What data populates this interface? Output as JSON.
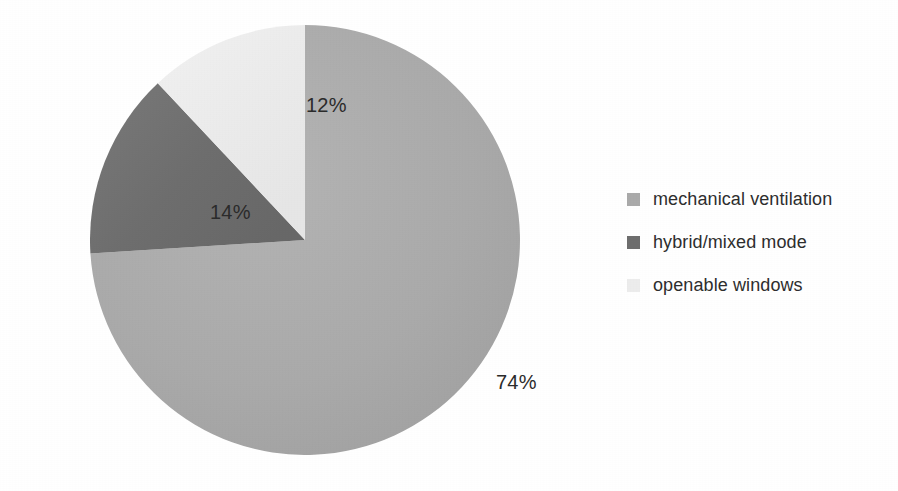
{
  "figure": {
    "background_color": "#ffffff",
    "text_color": "#2e2e2e"
  },
  "chart_data": {
    "type": "pie",
    "title": "",
    "xlabel": "",
    "ylabel": "",
    "categories": [
      "mechanical ventilation",
      "hybrid/mixed mode",
      "openable windows"
    ],
    "values": [
      74,
      14,
      12
    ],
    "value_labels": [
      "74%",
      "14%",
      "12%"
    ],
    "unit": "%",
    "total": 100,
    "colors": [
      "#aaaaaa",
      "#6e6e6e",
      "#ececec"
    ],
    "start_angle_deg": 0,
    "direction": "clockwise",
    "legend_position": "right",
    "grid": false,
    "slices": [
      {
        "label": "mechanical ventilation",
        "value": 74,
        "value_label": "74%",
        "color": "#aaaaaa",
        "start_angle_deg": 0,
        "end_angle_deg": 266.4
      },
      {
        "label": "hybrid/mixed mode",
        "value": 14,
        "value_label": "14%",
        "color": "#6e6e6e",
        "start_angle_deg": 266.4,
        "end_angle_deg": 316.8
      },
      {
        "label": "openable windows",
        "value": 12,
        "value_label": "12%",
        "color": "#ececec",
        "start_angle_deg": 316.8,
        "end_angle_deg": 360
      }
    ]
  },
  "legend": {
    "items": [
      {
        "label": "mechanical ventilation",
        "color": "#aaaaaa"
      },
      {
        "label": "hybrid/mixed mode",
        "color": "#6e6e6e"
      },
      {
        "label": "openable windows",
        "color": "#ececec"
      }
    ]
  }
}
